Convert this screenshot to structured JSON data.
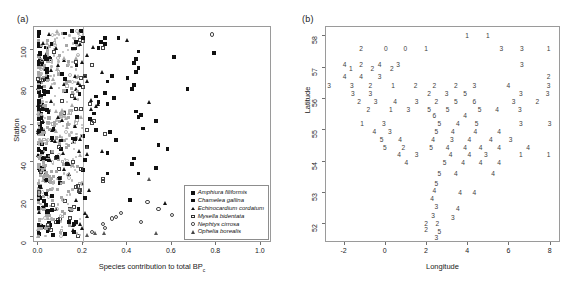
{
  "figure": {
    "panel_a_label": "(a)",
    "panel_b_label": "(b)"
  },
  "chart_data": [
    {
      "type": "scatter",
      "panel": "(a)",
      "title": "",
      "xlabel": "Species contribution to total BP",
      "xlabel_subscript": "c",
      "ylabel": "Station",
      "xlim": [
        -0.02,
        1.05
      ],
      "ylim": [
        -3,
        112
      ],
      "xticks": [
        "0.0",
        "0.2",
        "0.4",
        "0.6",
        "0.8",
        "1.0"
      ],
      "xtick_values": [
        0.0,
        0.2,
        0.4,
        0.6,
        0.8,
        1.0
      ],
      "yticks": [
        "0",
        "20",
        "40",
        "60",
        "80",
        "100"
      ],
      "ytick_values": [
        0,
        20,
        40,
        60,
        80,
        100
      ],
      "grid": false,
      "reference_line_x": 0.2,
      "reference_line_color": "#b4b4b4",
      "legend_position": "bottom-right",
      "legend": [
        {
          "label": "Amphiura filiformis",
          "marker": "filled-square",
          "color": "#111111"
        },
        {
          "label": "Chamelea gallina",
          "marker": "filled-square",
          "color": "#111111"
        },
        {
          "label": "Echinocardium cordatum",
          "marker": "filled-triangle",
          "color": "#111111"
        },
        {
          "label": "Mysella bidentata",
          "marker": "open-square",
          "color": "#333333"
        },
        {
          "label": "Nephtys cirrosa",
          "marker": "open-circle",
          "color": "#333333"
        },
        {
          "label": "Ophelia borealis",
          "marker": "open-triangle",
          "color": "#444444"
        }
      ],
      "series": [
        {
          "name": "Amphiura filiformis",
          "marker": "filled-square",
          "points": [
            [
              0.3,
              106
            ],
            [
              0.36,
              106
            ],
            [
              0.28,
              104
            ],
            [
              0.3,
              103
            ],
            [
              0.27,
              101
            ],
            [
              0.45,
              99
            ],
            [
              0.79,
              98
            ],
            [
              0.61,
              96
            ],
            [
              0.44,
              95
            ],
            [
              0.43,
              93
            ],
            [
              0.45,
              90
            ],
            [
              0.44,
              88
            ],
            [
              0.33,
              86
            ],
            [
              0.4,
              85
            ],
            [
              0.31,
              83
            ],
            [
              0.43,
              81
            ],
            [
              0.67,
              79
            ],
            [
              0.42,
              79
            ],
            [
              0.3,
              77
            ],
            [
              0.26,
              75
            ],
            [
              0.34,
              74
            ],
            [
              0.27,
              72
            ],
            [
              0.31,
              71
            ],
            [
              0.44,
              67
            ],
            [
              0.25,
              66
            ],
            [
              0.46,
              65
            ],
            [
              0.45,
              64
            ],
            [
              0.23,
              63
            ],
            [
              0.53,
              62
            ],
            [
              0.47,
              58
            ],
            [
              0.26,
              57
            ],
            [
              0.32,
              56
            ],
            [
              0.2,
              54
            ],
            [
              0.35,
              52
            ],
            [
              0.54,
              49
            ],
            [
              0.22,
              48
            ],
            [
              0.58,
              47
            ],
            [
              0.31,
              45
            ],
            [
              0.43,
              42
            ],
            [
              0.21,
              41
            ],
            [
              0.42,
              39
            ],
            [
              0.53,
              37
            ],
            [
              0.2,
              36
            ],
            [
              0.31,
              34
            ],
            [
              0.45,
              34
            ],
            [
              0.21,
              21
            ],
            [
              0.41,
              20
            ],
            [
              0.18,
              15
            ],
            [
              0.12,
              2
            ],
            [
              0.16,
              3
            ]
          ]
        },
        {
          "name": "Echinocardium cordatum",
          "marker": "filled-triangle",
          "points": [
            [
              0.4,
              105
            ],
            [
              0.25,
              101
            ],
            [
              0.22,
              97
            ],
            [
              0.2,
              93
            ],
            [
              0.29,
              88
            ],
            [
              0.21,
              86
            ],
            [
              0.22,
              83
            ],
            [
              0.17,
              79
            ],
            [
              0.24,
              73
            ],
            [
              0.5,
              72
            ],
            [
              0.27,
              71
            ],
            [
              0.26,
              70
            ],
            [
              0.24,
              68
            ],
            [
              0.29,
              46
            ],
            [
              0.22,
              44
            ],
            [
              0.2,
              29
            ],
            [
              0.23,
              25
            ],
            [
              0.19,
              24
            ],
            [
              0.57,
              18
            ],
            [
              0.21,
              13
            ],
            [
              0.22,
              11
            ],
            [
              0.19,
              7
            ],
            [
              0.2,
              5
            ],
            [
              0.16,
              4
            ]
          ]
        },
        {
          "name": "Mysella bidentata",
          "marker": "open-square",
          "points": [
            [
              0.29,
              101
            ],
            [
              0.24,
              92
            ],
            [
              0.21,
              86
            ],
            [
              0.2,
              80
            ],
            [
              0.23,
              71
            ],
            [
              0.25,
              62
            ],
            [
              0.24,
              61
            ],
            [
              0.22,
              57
            ],
            [
              0.3,
              55
            ],
            [
              0.29,
              31
            ],
            [
              0.29,
              30
            ],
            [
              0.16,
              16
            ],
            [
              0.14,
              15
            ],
            [
              0.09,
              9
            ],
            [
              0.08,
              8
            ]
          ]
        },
        {
          "name": "Nephtys cirrosa",
          "marker": "open-circle",
          "points": [
            [
              0.78,
              108
            ],
            [
              0.49,
              19
            ],
            [
              0.54,
              15
            ],
            [
              0.6,
              12
            ],
            [
              0.37,
              13
            ],
            [
              0.35,
              11
            ],
            [
              0.33,
              10
            ],
            [
              0.46,
              8
            ],
            [
              0.29,
              7
            ],
            [
              0.3,
              5
            ],
            [
              0.24,
              3
            ]
          ]
        },
        {
          "name": "Ophelia borealis",
          "marker": "open-triangle",
          "points": [
            [
              0.22,
              48
            ],
            [
              0.5,
              31
            ],
            [
              0.53,
              2
            ],
            [
              0.3,
              2
            ],
            [
              0.26,
              2
            ],
            [
              0.22,
              1
            ]
          ]
        },
        {
          "name": "background-low-contribution-cloud",
          "marker": "gray-mixed",
          "note": "dense cloud of grey and black markers between x=0.0 and x=0.2 spanning all stations"
        }
      ]
    },
    {
      "type": "scatter",
      "panel": "(b)",
      "title": "",
      "xlabel": "Longitude",
      "ylabel": "Latitude",
      "xlim": [
        -2.9,
        8.5
      ],
      "ylim": [
        51.4,
        58.3
      ],
      "xticks": [
        "-2",
        "0",
        "2",
        "4",
        "6",
        "8"
      ],
      "xtick_values": [
        -2,
        0,
        2,
        4,
        6,
        8
      ],
      "yticks": [
        "52",
        "53",
        "54",
        "55",
        "56",
        "57",
        "58"
      ],
      "ytick_values": [
        52,
        53,
        54,
        55,
        56,
        57,
        58
      ],
      "grid": false,
      "marker_style": "digit-label",
      "note": "each point plotted as its cluster-number digit",
      "points": [
        [
          3.95,
          58.0,
          "1"
        ],
        [
          4.95,
          58.0,
          "1"
        ],
        [
          -1.2,
          57.6,
          "2"
        ],
        [
          0.0,
          57.6,
          "0"
        ],
        [
          0.95,
          57.6,
          "0"
        ],
        [
          1.95,
          57.6,
          "1"
        ],
        [
          5.6,
          57.6,
          "3"
        ],
        [
          6.6,
          57.6,
          "3"
        ],
        [
          7.9,
          57.6,
          "1"
        ],
        [
          -2.0,
          57.1,
          "4"
        ],
        [
          -1.2,
          57.1,
          "2"
        ],
        [
          -0.3,
          57.1,
          "4"
        ],
        [
          0.6,
          57.1,
          "3"
        ],
        [
          6.6,
          57.1,
          "3"
        ],
        [
          -1.7,
          56.95,
          "1"
        ],
        [
          -0.65,
          56.95,
          "2"
        ],
        [
          0.3,
          56.95,
          "2"
        ],
        [
          -2.0,
          56.7,
          "4"
        ],
        [
          -1.2,
          56.7,
          "4"
        ],
        [
          -0.3,
          56.7,
          "3"
        ],
        [
          7.9,
          56.7,
          "2"
        ],
        [
          -2.75,
          56.4,
          "3"
        ],
        [
          -1.65,
          56.4,
          "3"
        ],
        [
          -0.75,
          56.4,
          "2"
        ],
        [
          0.35,
          56.4,
          "1"
        ],
        [
          1.45,
          56.4,
          "2"
        ],
        [
          2.35,
          56.4,
          "2"
        ],
        [
          3.4,
          56.4,
          "2"
        ],
        [
          4.3,
          56.4,
          "3"
        ],
        [
          5.95,
          56.4,
          "4"
        ],
        [
          7.9,
          56.4,
          "3"
        ],
        [
          -1.6,
          56.15,
          "3"
        ],
        [
          -0.75,
          56.15,
          "3"
        ],
        [
          2.1,
          56.15,
          "2"
        ],
        [
          2.95,
          56.15,
          "3"
        ],
        [
          3.85,
          56.15,
          "5"
        ],
        [
          6.55,
          56.15,
          "3"
        ],
        [
          7.85,
          56.15,
          "3"
        ],
        [
          -1.3,
          55.9,
          "2"
        ],
        [
          -0.5,
          55.9,
          "3"
        ],
        [
          0.45,
          55.9,
          "4"
        ],
        [
          1.5,
          55.9,
          "3"
        ],
        [
          2.45,
          55.9,
          "2"
        ],
        [
          3.4,
          55.9,
          "5"
        ],
        [
          4.3,
          55.9,
          "6"
        ],
        [
          6.2,
          55.9,
          "3"
        ],
        [
          7.35,
          55.9,
          "2"
        ],
        [
          -0.85,
          55.65,
          "2"
        ],
        [
          0.25,
          55.65,
          "1"
        ],
        [
          1.1,
          55.65,
          "3"
        ],
        [
          2.1,
          55.65,
          "5"
        ],
        [
          3.0,
          55.65,
          "5"
        ],
        [
          4.55,
          55.65,
          "5"
        ],
        [
          5.4,
          55.65,
          "4"
        ],
        [
          6.5,
          55.65,
          "3"
        ],
        [
          2.35,
          55.45,
          "6"
        ],
        [
          3.85,
          55.45,
          "4"
        ],
        [
          -1.15,
          55.2,
          "1"
        ],
        [
          -0.1,
          55.2,
          "3"
        ],
        [
          2.6,
          55.2,
          "5"
        ],
        [
          3.5,
          55.2,
          "4"
        ],
        [
          4.4,
          55.2,
          "5"
        ],
        [
          6.55,
          55.2,
          "3"
        ],
        [
          7.95,
          55.2,
          "3"
        ],
        [
          -0.55,
          54.95,
          "4"
        ],
        [
          0.2,
          54.95,
          "3"
        ],
        [
          2.45,
          54.95,
          "5"
        ],
        [
          3.25,
          54.95,
          "4"
        ],
        [
          4.35,
          54.95,
          "4"
        ],
        [
          5.5,
          54.95,
          "4"
        ],
        [
          -0.2,
          54.7,
          "5"
        ],
        [
          0.7,
          54.7,
          "4"
        ],
        [
          2.3,
          54.7,
          "4"
        ],
        [
          3.2,
          54.7,
          "3"
        ],
        [
          4.05,
          54.7,
          "4"
        ],
        [
          5.1,
          54.7,
          "4"
        ],
        [
          6.05,
          54.7,
          "3"
        ],
        [
          -0.05,
          54.45,
          "5"
        ],
        [
          0.85,
          54.45,
          "2"
        ],
        [
          2.2,
          54.45,
          "5"
        ],
        [
          3.0,
          54.45,
          "4"
        ],
        [
          3.85,
          54.45,
          "4"
        ],
        [
          4.6,
          54.45,
          "4"
        ],
        [
          5.5,
          54.45,
          "4"
        ],
        [
          6.9,
          54.45,
          "4"
        ],
        [
          0.65,
          54.2,
          "4"
        ],
        [
          1.5,
          54.2,
          "3"
        ],
        [
          3.15,
          54.2,
          "4"
        ],
        [
          4.05,
          54.2,
          "4"
        ],
        [
          4.85,
          54.2,
          "3"
        ],
        [
          6.55,
          54.2,
          "1"
        ],
        [
          7.9,
          54.2,
          "1"
        ],
        [
          1.0,
          53.95,
          "4"
        ],
        [
          2.85,
          53.95,
          "5"
        ],
        [
          3.75,
          53.95,
          "4"
        ],
        [
          4.6,
          53.95,
          "4"
        ],
        [
          5.5,
          53.95,
          "4"
        ],
        [
          2.6,
          53.6,
          "5"
        ],
        [
          3.4,
          53.6,
          "4"
        ],
        [
          5.2,
          53.6,
          "4"
        ],
        [
          2.45,
          53.3,
          "5"
        ],
        [
          2.35,
          53.05,
          "4"
        ],
        [
          3.6,
          53.0,
          "4"
        ],
        [
          4.3,
          53.0,
          "4"
        ],
        [
          2.25,
          52.8,
          "4"
        ],
        [
          2.45,
          52.55,
          "3"
        ],
        [
          3.5,
          52.5,
          "4"
        ],
        [
          2.3,
          52.25,
          "3"
        ],
        [
          3.25,
          52.2,
          "3"
        ],
        [
          1.95,
          52.0,
          "2"
        ],
        [
          2.5,
          52.0,
          "2"
        ],
        [
          1.95,
          51.8,
          "2"
        ],
        [
          2.6,
          51.75,
          "5"
        ],
        [
          2.45,
          51.55,
          "3"
        ]
      ]
    }
  ]
}
